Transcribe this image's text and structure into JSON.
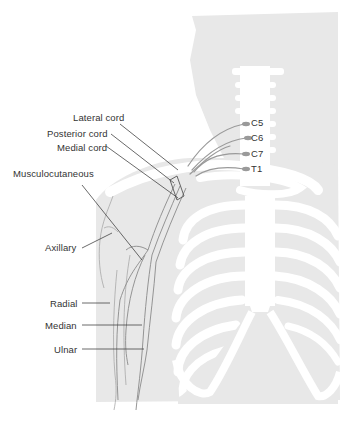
{
  "figure": {
    "colors": {
      "background": "#ffffff",
      "silhouette": "#e8e8e8",
      "bone": "#ffffff",
      "nerve": "#9a9a9a",
      "leader_line": "#444444",
      "text": "#333333"
    }
  },
  "labels": {
    "roots": [
      {
        "id": "c5",
        "text": "C5"
      },
      {
        "id": "c6",
        "text": "C6"
      },
      {
        "id": "c7",
        "text": "C7"
      },
      {
        "id": "t1",
        "text": "T1"
      }
    ],
    "cords": [
      {
        "id": "lateral",
        "text": "Lateral cord"
      },
      {
        "id": "posterior",
        "text": "Posterior cord"
      },
      {
        "id": "medial",
        "text": "Medial cord"
      }
    ],
    "nerves": [
      {
        "id": "musculocutaneous",
        "text": "Musculocutaneous"
      },
      {
        "id": "axillary",
        "text": "Axillary"
      },
      {
        "id": "radial",
        "text": "Radial"
      },
      {
        "id": "median",
        "text": "Median"
      },
      {
        "id": "ulnar",
        "text": "Ulnar"
      }
    ]
  }
}
